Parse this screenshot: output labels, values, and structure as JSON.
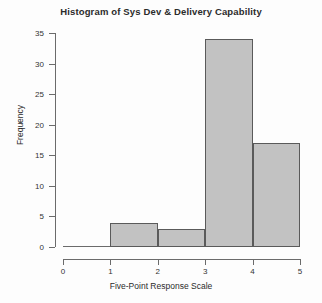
{
  "chart_data": {
    "type": "bar",
    "title": "Histogram of Sys Dev & Delivery Capability",
    "xlabel": "Five-Point Response Scale",
    "ylabel": "Frequency",
    "categories": [
      "0-1",
      "1-2",
      "2-3",
      "3-4",
      "4-5"
    ],
    "bin_edges": [
      0,
      1,
      2,
      3,
      4,
      5
    ],
    "values": [
      0,
      4,
      3,
      34,
      17
    ],
    "xlim": [
      0,
      5
    ],
    "ylim": [
      0,
      35
    ],
    "x_ticks": [
      "0",
      "1",
      "2",
      "3",
      "4",
      "5"
    ],
    "x_tick_values": [
      0,
      1,
      2,
      3,
      4,
      5
    ],
    "y_ticks": [
      "0",
      "5",
      "10",
      "15",
      "20",
      "25",
      "30",
      "35"
    ],
    "y_tick_values": [
      0,
      5,
      10,
      15,
      20,
      25,
      30,
      35
    ],
    "grid": false,
    "legend": null,
    "bar_fill_color": "#c2c2c2",
    "bar_border_color": "#5a5a5a",
    "axis_color": "#6b6b6b",
    "text_color": "#2b2b2b",
    "background_color": "#fdfdfd"
  }
}
